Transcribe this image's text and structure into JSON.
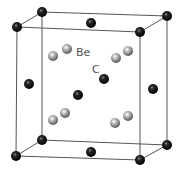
{
  "diagram": {
    "title": "",
    "type": "crystal-unit-cell",
    "labels": {
      "be": "Be",
      "c": "C"
    },
    "colors": {
      "c_atom": "#111111",
      "be_atom": "#8a8a8a",
      "edge": "#555555",
      "label": "#555555"
    }
  }
}
